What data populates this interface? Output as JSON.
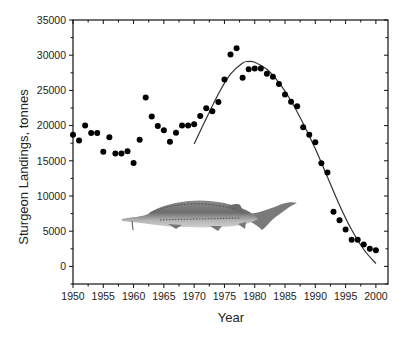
{
  "chart_data": {
    "type": "scatter",
    "title": "",
    "xlabel": "Year",
    "ylabel": "Sturgeon Landings, tonnes",
    "xlim": [
      1950,
      2002
    ],
    "ylim": [
      -2500,
      35000
    ],
    "x_ticks": [
      1950,
      1955,
      1960,
      1965,
      1970,
      1975,
      1980,
      1985,
      1990,
      1995,
      2000
    ],
    "y_ticks": [
      0,
      5000,
      10000,
      15000,
      20000,
      25000,
      30000,
      35000
    ],
    "grid": false,
    "legend": null,
    "series": [
      {
        "name": "Landings (observed)",
        "type": "scatter",
        "marker": "filled-circle",
        "color": "#000000",
        "x": [
          1950,
          1951,
          1952,
          1953,
          1954,
          1955,
          1956,
          1957,
          1958,
          1959,
          1960,
          1961,
          1962,
          1963,
          1964,
          1965,
          1966,
          1967,
          1968,
          1969,
          1970,
          1971,
          1972,
          1973,
          1974,
          1975,
          1976,
          1977,
          1978,
          1979,
          1980,
          1981,
          1982,
          1983,
          1984,
          1985,
          1986,
          1987,
          1988,
          1989,
          1990,
          1991,
          1992,
          1993,
          1994,
          1995,
          1996,
          1997,
          1998,
          1999,
          2000
        ],
        "values": [
          18700,
          17900,
          20000,
          18950,
          18950,
          16300,
          18350,
          16050,
          16050,
          16350,
          14700,
          18000,
          24000,
          21300,
          19950,
          19350,
          17700,
          19000,
          20000,
          20000,
          20200,
          21350,
          22450,
          22050,
          23350,
          26550,
          30100,
          31000,
          26800,
          28000,
          28100,
          28100,
          27350,
          26950,
          25900,
          24400,
          23400,
          22750,
          19750,
          18700,
          17650,
          14650,
          13350,
          7750,
          6550,
          5250,
          3800,
          3800,
          3100,
          2500,
          2300
        ]
      },
      {
        "name": "Fitted curve",
        "type": "line",
        "color": "#333333",
        "x": [
          1970,
          1972,
          1974,
          1976,
          1978,
          1979,
          1980,
          1982,
          1984,
          1986,
          1988,
          1990,
          1992,
          1994,
          1996,
          1998,
          2000
        ],
        "values": [
          17400,
          21000,
          24500,
          27300,
          28900,
          29100,
          29000,
          28000,
          26100,
          23500,
          20300,
          16700,
          12700,
          8700,
          5200,
          2400,
          400
        ]
      }
    ],
    "annotations": [
      {
        "type": "image",
        "description": "sturgeon-fish illustration",
        "x_range": [
          1958,
          1987
        ],
        "y_range": [
          2500,
          9300
        ]
      }
    ]
  },
  "axes": {
    "x_tick_labels": [
      "1950",
      "1955",
      "1960",
      "1965",
      "1970",
      "1975",
      "1980",
      "1985",
      "1990",
      "1995",
      "2000"
    ],
    "y_tick_labels": [
      "0",
      "5000",
      "10000",
      "15000",
      "20000",
      "25000",
      "30000",
      "35000"
    ]
  }
}
